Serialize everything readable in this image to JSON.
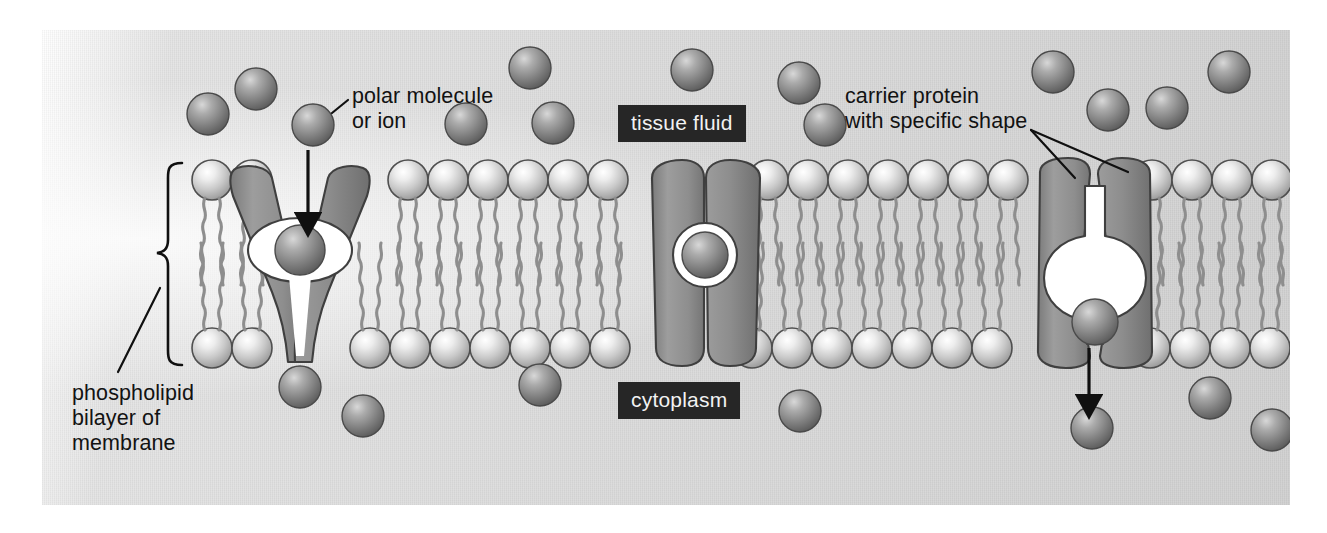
{
  "figure": {
    "type": "biology-diagram",
    "background_color": "#d9d9d9",
    "panel_color": "#dcdcdc",
    "ink_color": "#121212",
    "box_fill": "#262626",
    "box_text_color": "#f2f2f2",
    "protein_color": "#8c8c8c",
    "head_color": "#c8c8c8",
    "solute_color": "#8a8a8a"
  },
  "labels": {
    "polar_molecule": "polar molecule\nor ion",
    "carrier_protein": "carrier protein\nwith specific shape",
    "phospholipid_bilayer": "phospholipid\nbilayer of\nmembrane",
    "tissue_fluid": "tissue fluid",
    "cytoplasm": "cytoplasm"
  },
  "regions": {
    "outside_label": "tissue fluid",
    "inside_label": "cytoplasm"
  },
  "proteins": [
    {
      "name": "left-carrier-protein",
      "state": "open to tissue fluid",
      "x": 300
    },
    {
      "name": "centre-carrier-protein",
      "state": "closed, molecule enclosed",
      "x": 690
    },
    {
      "name": "right-carrier-protein",
      "state": "open to cytoplasm",
      "x": 1085
    }
  ],
  "arrows": [
    {
      "name": "entry-arrow",
      "direction": "down",
      "from": "tissue fluid",
      "to": "left protein channel"
    },
    {
      "name": "exit-arrow",
      "direction": "down",
      "from": "right protein channel",
      "to": "cytoplasm"
    }
  ],
  "counts": {
    "phospholipid_head_diameter_px": 40,
    "bilayer_top_y": 180,
    "bilayer_bottom_y": 348
  }
}
